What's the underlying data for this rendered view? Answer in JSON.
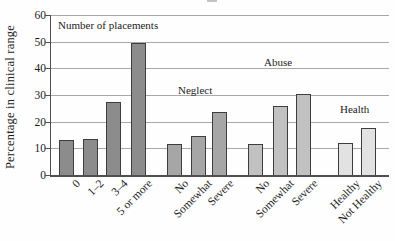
{
  "chart_data": {
    "type": "bar",
    "title": "",
    "ylabel": "Percentage in clinical range",
    "xlabel": "",
    "ylim": [
      0,
      60
    ],
    "yticks": [
      0,
      10,
      20,
      30,
      40,
      50,
      60
    ],
    "grid": "horizontal",
    "legend": "none",
    "note": "group names are annotated inside the plot area above each bar cluster",
    "groups": [
      {
        "name": "Number of placements",
        "color": "#8c8c8c",
        "label_pos": {
          "x": 58,
          "y": 19
        },
        "bars": [
          {
            "label": "0",
            "value": 13,
            "x": 8
          },
          {
            "label": "1–2",
            "value": 13.5,
            "x": 31.5
          },
          {
            "label": "3–4",
            "value": 27.5,
            "x": 55
          },
          {
            "label": "5 or more",
            "value": 49.5,
            "x": 80
          }
        ]
      },
      {
        "name": "Neglect",
        "color": "#a6a6a6",
        "label_pos": {
          "x": 178,
          "y": 84
        },
        "bars": [
          {
            "label": "No",
            "value": 11.5,
            "x": 116
          },
          {
            "label": "Somewhat",
            "value": 14.5,
            "x": 139.5
          },
          {
            "label": "Severe",
            "value": 23.5,
            "x": 161
          }
        ]
      },
      {
        "name": "Abuse",
        "color": "#c1c1c1",
        "label_pos": {
          "x": 264,
          "y": 56
        },
        "bars": [
          {
            "label": "No",
            "value": 11.5,
            "x": 197
          },
          {
            "label": "Somewhat",
            "value": 26,
            "x": 222
          },
          {
            "label": "Severe",
            "value": 30.5,
            "x": 245
          }
        ]
      },
      {
        "name": "Health",
        "color": "#e2e2e2",
        "label_pos": {
          "x": 340,
          "y": 103
        },
        "bars": [
          {
            "label": "Healthy",
            "value": 12,
            "x": 287
          },
          {
            "label": "Not Healthy",
            "value": 17.5,
            "x": 309.5
          }
        ]
      }
    ]
  }
}
